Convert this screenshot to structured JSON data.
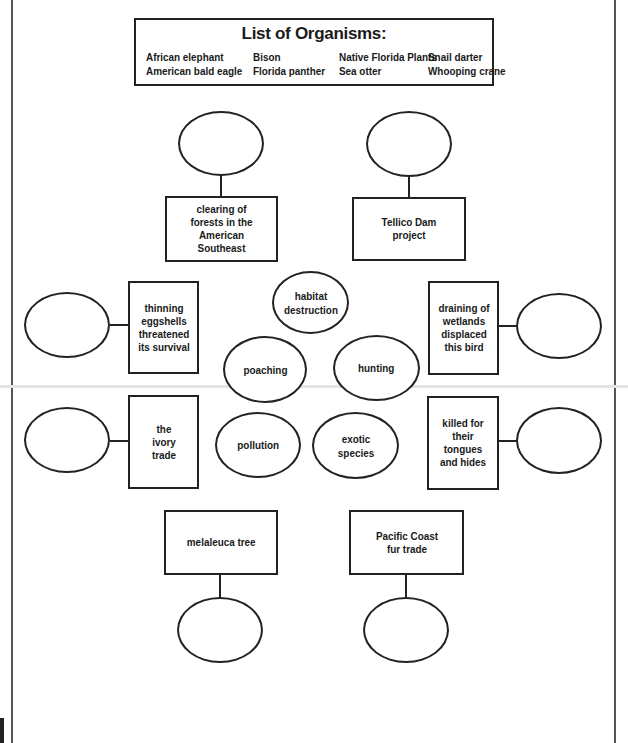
{
  "legend": {
    "title": "List of Organisms:",
    "columns": [
      [
        "African elephant",
        "American bald eagle"
      ],
      [
        "Bison",
        "Florida panther"
      ],
      [
        "Native Florida Plants",
        "Sea otter"
      ],
      [
        "Snail darter",
        "Whooping crane"
      ]
    ]
  },
  "clues": {
    "top_left": "clearing of forests in the American Southeast",
    "top_right": "Tellico Dam project",
    "mid_left_upper": "thinning eggshells threatened its survival",
    "mid_left_lower": "the ivory trade",
    "mid_right_upper": "draining of wetlands displaced this bird",
    "mid_right_lower": "killed for their tongues and hides",
    "bottom_left": "melaleuca tree",
    "bottom_right": "Pacific Coast fur trade"
  },
  "causes": {
    "habitat": "habitat destruction",
    "poaching": "poaching",
    "hunting": "hunting",
    "pollution": "pollution",
    "exotic": "exotic species"
  },
  "answers": {
    "top_left": "",
    "top_right": "",
    "mid_left_upper": "",
    "mid_left_lower": "",
    "mid_right_upper": "",
    "mid_right_lower": "",
    "bottom_left": "",
    "bottom_right": ""
  }
}
